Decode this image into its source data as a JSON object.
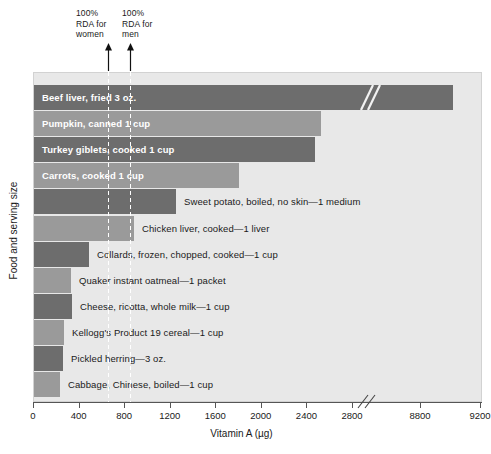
{
  "chart_data": {
    "type": "bar",
    "orientation": "horizontal",
    "title": "",
    "xlabel": "Vitamin A (µg)",
    "ylabel": "Food and serving size",
    "xlim": [
      0,
      9200
    ],
    "grid": false,
    "axis_break": {
      "after": 2800,
      "before": 8800,
      "label": "//"
    },
    "categories": [
      "Beef liver, fried 3 oz.",
      "Pumpkin, canned 1 cup",
      "Turkey giblets, cooked 1 cup",
      "Carrots, cooked 1 cup",
      "Sweet potato, boiled, no skin—1 medium",
      "Chicken liver, cooked—1 liver",
      "Collards, frozen, chopped, cooked—1 cup",
      "Quaker instant oatmeal—1 packet",
      "Cheese, ricotta, whole milk—1 cup",
      "Kellogg's Product 19 cereal—1 cup",
      "Pickled herring—3 oz.",
      "Cabbage, Chinese, boiled—1 cup"
    ],
    "values": [
      9124,
      2650,
      2580,
      1900,
      1420,
      910,
      500,
      270,
      280,
      220,
      220,
      180
    ],
    "xticks": [
      0,
      400,
      800,
      1200,
      1600,
      2000,
      2400,
      2800,
      8800,
      9200
    ],
    "xtick_labels": [
      "0",
      "400",
      "800",
      "1200",
      "1600",
      "2000",
      "2400",
      "2800",
      "8800",
      "9200"
    ],
    "annotations": [
      {
        "name": "rda-women",
        "text": "100%\nRDA for\nwomen",
        "value": 700
      },
      {
        "name": "rda-men",
        "text": "100%\nRDA for\nmen",
        "value": 900
      }
    ],
    "colors": {
      "bar_dark": "#6d6d6d",
      "bar_light": "#9a9a9a",
      "plot_background": "#e8e8e8",
      "page_background": "#ffffff",
      "axis": "#555555",
      "inside_label": "#ffffff",
      "outside_label": "#1a1a1a"
    },
    "bars": [
      {
        "label": "Beef liver, fried 3 oz.",
        "value": 9124,
        "px_end": 452,
        "shade": "dark",
        "label_placement": "inside",
        "has_break": true
      },
      {
        "label": "Pumpkin, canned 1 cup",
        "value": 2650,
        "px_end": 320,
        "shade": "light",
        "label_placement": "inside",
        "has_break": false
      },
      {
        "label": "Turkey giblets, cooked 1 cup",
        "value": 2580,
        "px_end": 314,
        "shade": "dark",
        "label_placement": "inside",
        "has_break": false
      },
      {
        "label": "Carrots, cooked 1 cup",
        "value": 1900,
        "px_end": 238,
        "shade": "light",
        "label_placement": "inside",
        "has_break": false
      },
      {
        "label": "Sweet potato, boiled, no skin—1 medium",
        "value": 1420,
        "px_end": 175,
        "shade": "dark",
        "label_placement": "outside",
        "has_break": false
      },
      {
        "label": "Chicken liver, cooked—1 liver",
        "value": 910,
        "px_end": 133,
        "shade": "light",
        "label_placement": "outside",
        "has_break": false
      },
      {
        "label": "Collards, frozen, chopped, cooked—1 cup",
        "value": 500,
        "px_end": 88,
        "shade": "dark",
        "label_placement": "outside",
        "has_break": false
      },
      {
        "label": "Quaker instant oatmeal—1 packet",
        "value": 270,
        "px_end": 70,
        "shade": "light",
        "label_placement": "outside",
        "has_break": false
      },
      {
        "label": "Cheese, ricotta, whole milk—1 cup",
        "value": 280,
        "px_end": 71,
        "shade": "dark",
        "label_placement": "outside",
        "has_break": false
      },
      {
        "label": "Kellogg's Product 19 cereal—1 cup",
        "value": 220,
        "px_end": 63,
        "shade": "light",
        "label_placement": "outside",
        "has_break": false
      },
      {
        "label": "Pickled herring—3 oz.",
        "value": 220,
        "px_end": 62,
        "shade": "dark",
        "label_placement": "outside",
        "has_break": false
      },
      {
        "label": "Cabbage, Chinese, boiled—1 cup",
        "value": 180,
        "px_end": 59,
        "shade": "light",
        "label_placement": "outside",
        "has_break": false
      }
    ]
  }
}
